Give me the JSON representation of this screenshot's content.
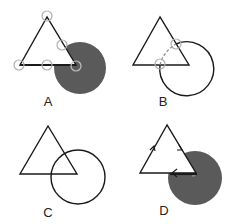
{
  "panels": [
    {
      "id": "A",
      "label": "A",
      "description": "Triangle with shaded disk overlapping its lower-right corner; gray circles mark vertices and intersection points"
    },
    {
      "id": "B",
      "label": "B",
      "description": "Triangle and circle; dashed arc between two circled intersection points"
    },
    {
      "id": "C",
      "label": "C",
      "description": "Triangle and circle overlapping, plain outlines"
    },
    {
      "id": "D",
      "label": "D",
      "description": "Triangle traversed with direction arrows, shaded disk overlapping lower-right corner, shadowed edge"
    }
  ],
  "colors": {
    "stroke": "#1a1a1a",
    "shaded_disk": "#5a5a5a",
    "marker_circle": "#b0b0b0",
    "shadow": "#9a9a9a",
    "background": "#ffffff"
  }
}
